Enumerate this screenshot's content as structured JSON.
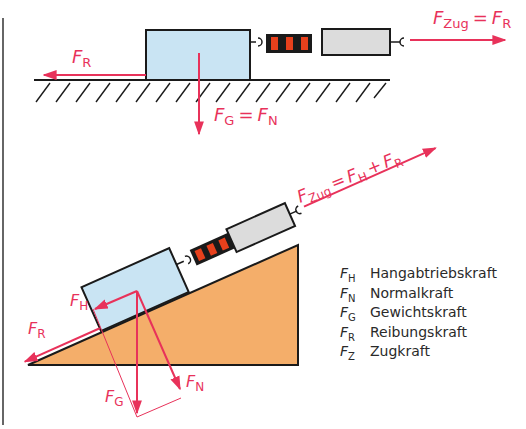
{
  "colors": {
    "force": "#e8325a",
    "block": "#c9e4f3",
    "spring_red": "#e8401c",
    "spring_black": "#1a1a1a",
    "scale_body": "#dcdcdc",
    "ramp": "#f4ae6a",
    "outline": "#1a1a1a",
    "text": "#2a2a2a"
  },
  "top_diagram": {
    "friction_label": {
      "base": "F",
      "sub": "R"
    },
    "weight_label": {
      "base": "F",
      "sub": "G",
      "eq": "=",
      "base2": "F",
      "sub2": "N"
    },
    "pull_label": {
      "base": "F",
      "sub": "Zug",
      "eq": "=",
      "base2": "F",
      "sub2": "R"
    }
  },
  "incline_diagram": {
    "pull_label": {
      "base": "F",
      "sub": "Zug",
      "eq": "=",
      "base2": "F",
      "sub2": "H",
      "plus": "+",
      "base3": "F",
      "sub3": "R"
    },
    "downslope_label": {
      "base": "F",
      "sub": "H"
    },
    "friction_label": {
      "base": "F",
      "sub": "R"
    },
    "weight_label": {
      "base": "F",
      "sub": "G"
    },
    "normal_label": {
      "base": "F",
      "sub": "N"
    }
  },
  "legend": [
    {
      "sym": "F",
      "sub": "H",
      "text": "Hangabtriebskraft"
    },
    {
      "sym": "F",
      "sub": "N",
      "text": "Normalkraft"
    },
    {
      "sym": "F",
      "sub": "G",
      "text": "Gewichtskraft"
    },
    {
      "sym": "F",
      "sub": "R",
      "text": "Reibungskraft"
    },
    {
      "sym": "F",
      "sub": "Z",
      "text": "Zugkraft"
    }
  ]
}
